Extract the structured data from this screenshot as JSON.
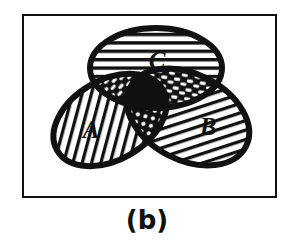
{
  "figure": {
    "caption": "(b)",
    "frame": {
      "stroke_color": "#111111",
      "background": "#ffffff"
    }
  },
  "venn": {
    "title": "three-set venn diagram",
    "sets": [
      {
        "id": "A",
        "label": "A",
        "fill_pattern": "diagonal-hatch-up",
        "outline_color": "#111111",
        "cx": 108,
        "cy": 118,
        "rx": 62,
        "ry": 42,
        "rotation": -32
      },
      {
        "id": "B",
        "label": "B",
        "fill_pattern": "diagonal-hatch-up",
        "outline_color": "#111111",
        "cx": 186,
        "cy": 115,
        "rx": 66,
        "ry": 44,
        "rotation": 28
      },
      {
        "id": "C",
        "label": "C",
        "fill_pattern": "horizontal-hatch",
        "outline_color": "#111111",
        "cx": 154,
        "cy": 66,
        "rx": 66,
        "ry": 41,
        "rotation": 0
      }
    ],
    "regions": [
      {
        "id": "A-only",
        "label": "A",
        "pattern": "diagonal-hatch-up"
      },
      {
        "id": "B-only",
        "label": "B",
        "pattern": "diagonal-hatch-up"
      },
      {
        "id": "C-only",
        "label": "C",
        "pattern": "horizontal-hatch"
      },
      {
        "id": "A-and-C",
        "label": "",
        "pattern": "inverse-crosshatch-dark"
      },
      {
        "id": "B-and-C",
        "label": "",
        "pattern": "inverse-crosshatch-dark"
      },
      {
        "id": "A-and-B",
        "label": "",
        "pattern": "dark-with-dots"
      },
      {
        "id": "A-and-B-and-C",
        "label": "",
        "pattern": "solid-black"
      }
    ],
    "colors": {
      "ink": "#111111",
      "paper": "#ffffff"
    }
  }
}
